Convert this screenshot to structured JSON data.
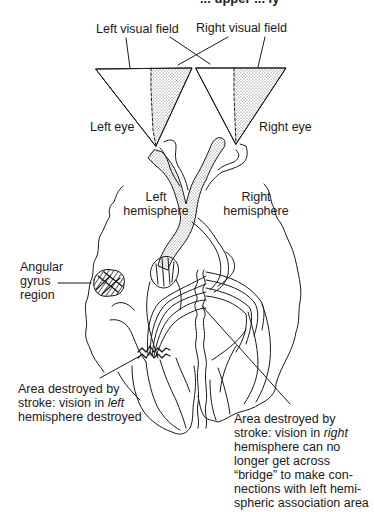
{
  "figure": {
    "top_cut_text": "... upper ... ly",
    "labels": {
      "left_visual_field": "Left visual field",
      "right_visual_field": "Right visual field",
      "left_eye": "Left eye",
      "right_eye": "Right eye",
      "left_hemisphere_line1": "Left",
      "left_hemisphere_line2": "hemisphere",
      "right_hemisphere_line1": "Right",
      "right_hemisphere_line2": "hemisphere",
      "angular_gyrus_line1": "Angular",
      "angular_gyrus_line2": "gyrus",
      "angular_gyrus_line3": "region",
      "left_stroke_line1": "Area destroyed by",
      "left_stroke_line2_pre": "stroke: vision in ",
      "left_stroke_line2_em": "left",
      "left_stroke_line3": "hemisphere destroyed",
      "right_stroke_line1": "Area destroyed by",
      "right_stroke_line2_pre": "stroke: vision in ",
      "right_stroke_line2_em": "right",
      "right_stroke_line3": "hemisphere can no",
      "right_stroke_line4": "longer get across",
      "right_stroke_line5": "“bridge” to make con-",
      "right_stroke_line6": "nections with left hemi-",
      "right_stroke_line7": "spheric association area"
    },
    "colors": {
      "line": "#1a1a1a",
      "stipple": "#555555",
      "background": "#ffffff"
    }
  }
}
